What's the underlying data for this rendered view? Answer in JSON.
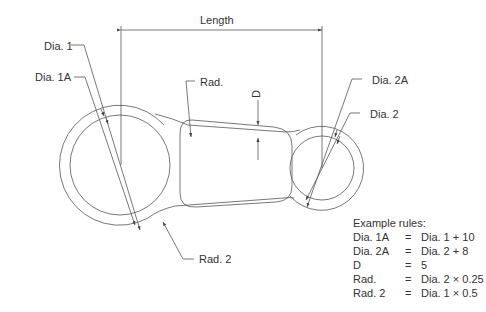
{
  "labels": {
    "length": "Length",
    "dia1": "Dia. 1",
    "dia1a": "Dia. 1A",
    "rad": "Rad.",
    "d": "D",
    "dia2a": "Dia. 2A",
    "dia2": "Dia. 2",
    "rad2": "Rad. 2"
  },
  "rules": {
    "title": "Example rules:",
    "items": [
      {
        "key": "Dia. 1A",
        "eq": "=",
        "value": "Dia. 1 + 10"
      },
      {
        "key": "Dia. 2A",
        "eq": "=",
        "value": "Dia. 2 + 8"
      },
      {
        "key": "D",
        "eq": "=",
        "value": "5"
      },
      {
        "key": "Rad.",
        "eq": "=",
        "value": "Dia. 2 × 0.25"
      },
      {
        "key": "Rad. 2",
        "eq": "=",
        "value": "Dia. 1 × 0.5"
      }
    ]
  }
}
